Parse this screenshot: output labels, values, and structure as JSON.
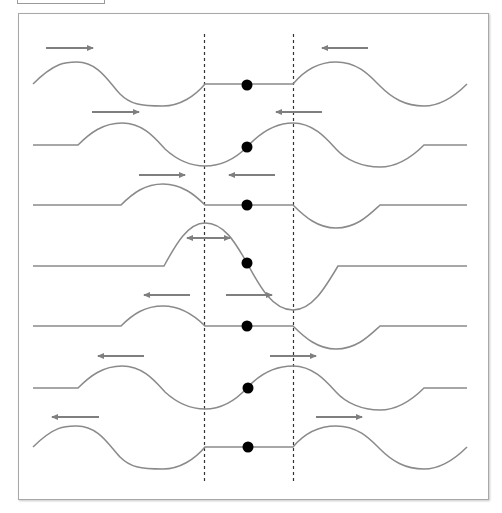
{
  "diagram": {
    "title": "",
    "colors": {
      "wave": "#8a8a8a",
      "arrow": "#7f7f7f",
      "dashed_line": "#333333",
      "dot": "#000000",
      "frame_border": "#a8a8a8"
    },
    "dashed_lines_x": [
      204,
      293
    ],
    "dashed_lines_y": [
      34,
      484
    ],
    "center_dot_x": 247,
    "dot_radius": 5.5,
    "rows": [
      {
        "index": 1,
        "baseline": 84,
        "dot_y": 85,
        "arrows": [
          {
            "x1": 46,
            "x2": 93,
            "y": 48,
            "dir": "right"
          },
          {
            "x1": 322,
            "x2": 368,
            "y": 48,
            "dir": "left"
          }
        ]
      },
      {
        "index": 2,
        "baseline": 145,
        "dot_y": 147,
        "arrows": [
          {
            "x1": 92,
            "x2": 139,
            "y": 112,
            "dir": "right"
          },
          {
            "x1": 276,
            "x2": 322,
            "y": 112,
            "dir": "left"
          }
        ]
      },
      {
        "index": 3,
        "baseline": 205,
        "dot_y": 205,
        "arrows": [
          {
            "x1": 139,
            "x2": 185,
            "y": 175,
            "dir": "right"
          },
          {
            "x1": 229,
            "x2": 275,
            "y": 175,
            "dir": "left"
          }
        ]
      },
      {
        "index": 4,
        "baseline": 266,
        "dot_y": 263,
        "arrows": [
          {
            "x1": 186,
            "x2": 230,
            "y": 238,
            "dir": "both"
          }
        ]
      },
      {
        "index": 5,
        "baseline": 326,
        "dot_y": 326,
        "arrows": [
          {
            "x1": 144,
            "x2": 190,
            "y": 295,
            "dir": "left"
          },
          {
            "x1": 226,
            "x2": 272,
            "y": 295,
            "dir": "right"
          }
        ]
      },
      {
        "index": 6,
        "baseline": 388,
        "dot_y": 388,
        "arrows": [
          {
            "x1": 98,
            "x2": 144,
            "y": 356,
            "dir": "left"
          },
          {
            "x1": 270,
            "x2": 316,
            "y": 356,
            "dir": "right"
          }
        ]
      },
      {
        "index": 7,
        "baseline": 447,
        "dot_y": 447,
        "arrows": [
          {
            "x1": 52,
            "x2": 99,
            "y": 417,
            "dir": "left"
          },
          {
            "x1": 316,
            "x2": 362,
            "y": 417,
            "dir": "right"
          }
        ]
      }
    ]
  }
}
